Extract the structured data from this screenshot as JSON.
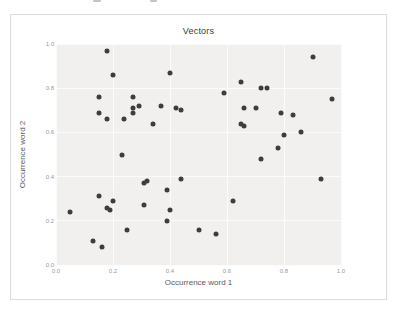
{
  "chart_data": {
    "type": "scatter",
    "title": "Vectors",
    "xlabel": "Occurrence word 1",
    "ylabel": "Occurrence word 2",
    "xlim": [
      0.0,
      1.0
    ],
    "ylim": [
      0.0,
      1.0
    ],
    "xticks": [
      "0.0",
      "0.2",
      "0.4",
      "0.6",
      "0.8",
      "1.0"
    ],
    "yticks": [
      "0.0",
      "0.2",
      "0.4",
      "0.6",
      "0.8",
      "1.0"
    ],
    "grid": true,
    "legend": false,
    "marker_color": "#3d3d3d",
    "plot_bg_color": "#f1f0ee",
    "grid_color": "#fbfbf9",
    "points": [
      [
        0.18,
        0.97
      ],
      [
        0.2,
        0.86
      ],
      [
        0.4,
        0.87
      ],
      [
        0.9,
        0.94
      ],
      [
        0.15,
        0.76
      ],
      [
        0.27,
        0.76
      ],
      [
        0.29,
        0.72
      ],
      [
        0.27,
        0.71
      ],
      [
        0.27,
        0.69
      ],
      [
        0.15,
        0.69
      ],
      [
        0.24,
        0.66
      ],
      [
        0.18,
        0.66
      ],
      [
        0.37,
        0.72
      ],
      [
        0.42,
        0.71
      ],
      [
        0.44,
        0.7
      ],
      [
        0.34,
        0.64
      ],
      [
        0.65,
        0.83
      ],
      [
        0.72,
        0.8
      ],
      [
        0.74,
        0.8
      ],
      [
        0.59,
        0.78
      ],
      [
        0.97,
        0.75
      ],
      [
        0.66,
        0.71
      ],
      [
        0.7,
        0.71
      ],
      [
        0.79,
        0.69
      ],
      [
        0.83,
        0.68
      ],
      [
        0.65,
        0.64
      ],
      [
        0.66,
        0.63
      ],
      [
        0.8,
        0.59
      ],
      [
        0.86,
        0.6
      ],
      [
        0.78,
        0.53
      ],
      [
        0.23,
        0.5
      ],
      [
        0.72,
        0.48
      ],
      [
        0.32,
        0.38
      ],
      [
        0.31,
        0.37
      ],
      [
        0.44,
        0.39
      ],
      [
        0.93,
        0.39
      ],
      [
        0.15,
        0.31
      ],
      [
        0.39,
        0.34
      ],
      [
        0.2,
        0.29
      ],
      [
        0.18,
        0.26
      ],
      [
        0.19,
        0.25
      ],
      [
        0.31,
        0.27
      ],
      [
        0.05,
        0.24
      ],
      [
        0.4,
        0.25
      ],
      [
        0.62,
        0.29
      ],
      [
        0.39,
        0.2
      ],
      [
        0.5,
        0.16
      ],
      [
        0.25,
        0.16
      ],
      [
        0.56,
        0.14
      ],
      [
        0.13,
        0.11
      ],
      [
        0.16,
        0.08
      ]
    ]
  }
}
